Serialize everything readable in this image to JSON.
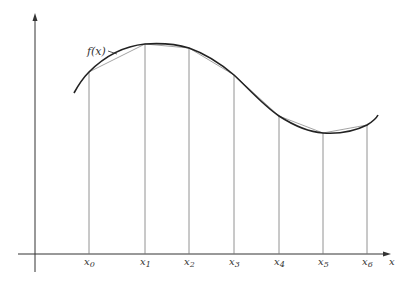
{
  "diagram": {
    "curve_label": "f(x)",
    "x_axis_label": "x",
    "nodes": [
      {
        "name": "x",
        "sub": "0",
        "px": 89,
        "py": 72
      },
      {
        "name": "x",
        "sub": "1",
        "px": 145,
        "py": 44
      },
      {
        "name": "x",
        "sub": "2",
        "px": 189,
        "py": 48
      },
      {
        "name": "x",
        "sub": "3",
        "px": 234,
        "py": 75
      },
      {
        "name": "x",
        "sub": "4",
        "px": 279,
        "py": 116
      },
      {
        "name": "x",
        "sub": "5",
        "px": 323,
        "py": 133
      },
      {
        "name": "x",
        "sub": "6",
        "px": 367,
        "py": 125
      }
    ],
    "colors": {
      "curve": "#222222",
      "chords": "#9a9a9a",
      "verticals": "#777777",
      "axes": "#333333"
    }
  }
}
